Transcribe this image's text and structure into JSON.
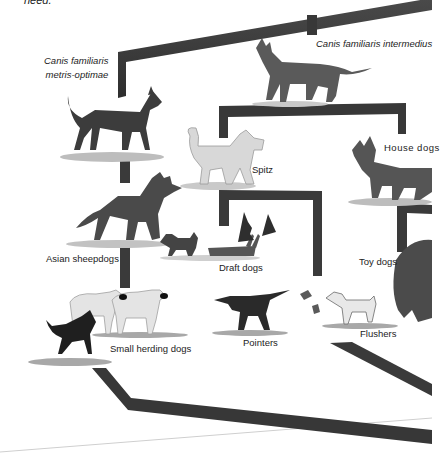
{
  "page": {
    "cut_text": "need."
  },
  "diagram": {
    "branch_color": "#3a3a3a",
    "nodes": [
      {
        "id": "metris-optimae",
        "label_line1": "Canis familiaris",
        "label_line2": "metris-optimae",
        "italic": true
      },
      {
        "id": "intermedius",
        "label": "Canis familiaris intermedius",
        "italic": true
      },
      {
        "id": "spitz",
        "label": "Spitz"
      },
      {
        "id": "house-dogs",
        "label": "House dogs"
      },
      {
        "id": "asian-sheepdogs",
        "label": "Asian sheepdogs"
      },
      {
        "id": "draft-dogs",
        "label": "Draft dogs"
      },
      {
        "id": "toy-dogs",
        "label": "Toy dogs"
      },
      {
        "id": "small-herding-dogs",
        "label": "Small herding dogs"
      },
      {
        "id": "pointers",
        "label": "Pointers"
      },
      {
        "id": "flushers",
        "label": "Flushers"
      }
    ]
  }
}
